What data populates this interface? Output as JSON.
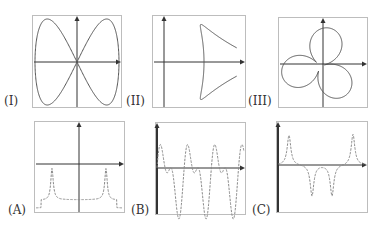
{
  "figure": {
    "top_row": [
      {
        "id": "I",
        "label": "(I)",
        "box": [
          32,
          15,
          90,
          93
        ],
        "axes": [
          77,
          62
        ],
        "curve": "figure-eight parametric curve"
      },
      {
        "id": "II",
        "label": "(II)",
        "box": [
          152,
          15,
          94,
          93
        ],
        "axes": [
          164,
          62
        ],
        "curve": "curve with two loops and diverging branches"
      },
      {
        "id": "III",
        "label": "(III)",
        "box": [
          278,
          17,
          90,
          91
        ],
        "axes": [
          323,
          64
        ],
        "curve": "three-leaf rose-like loop curve"
      }
    ],
    "bottom_row": [
      {
        "id": "A",
        "label": "(A)",
        "box": [
          34,
          121,
          91,
          92
        ],
        "axes": [
          79,
          164
        ],
        "curve": "two sharp peaks with flat trough"
      },
      {
        "id": "B",
        "label": "(B)",
        "box": [
          155,
          122,
          91,
          93
        ],
        "axes": [
          157,
          168
        ],
        "curve": "oscillating wave with alternating amplitudes"
      },
      {
        "id": "C",
        "label": "(C)",
        "box": [
          276,
          121,
          92,
          92
        ],
        "axes": [
          278,
          165
        ],
        "curve": "two positive and two negative sharp spikes"
      }
    ],
    "colors": {
      "frame": "#bdbdbd",
      "axis": "#333333",
      "curve": "#555555",
      "dashed_curve": "#8a8a8a"
    }
  }
}
